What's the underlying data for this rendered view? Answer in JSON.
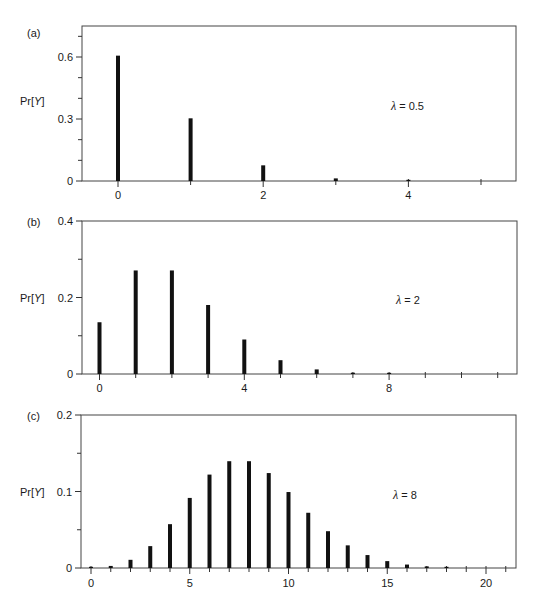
{
  "figure": {
    "colors": {
      "bar": "#111111",
      "axis": "#333333",
      "frame": "#444444",
      "text": "#1a1a1a",
      "background": "#ffffff"
    }
  },
  "chart_data": [
    {
      "type": "bar",
      "panel_label": "(a)",
      "title": "",
      "annotation": {
        "symbol": "λ",
        "text": "= 0.5"
      },
      "lambda": 0.5,
      "ylabel": "Pr[Y]",
      "xlabel": "",
      "x": [
        0,
        1,
        2,
        3,
        4
      ],
      "values": [
        0.6065,
        0.3033,
        0.0758,
        0.0126,
        0.0016
      ],
      "xlim": [
        -0.5,
        5.5
      ],
      "ylim": [
        0,
        0.75
      ],
      "x_major_ticks": [
        0,
        2,
        4
      ],
      "x_tick_labels": [
        "0",
        "2",
        "4"
      ],
      "x_minor_ticks": [
        1,
        3,
        5
      ],
      "y_major_ticks": [
        0,
        0.3,
        0.6
      ],
      "y_tick_labels": [
        "0",
        "0.3",
        "0.6"
      ],
      "y_minor_ticks": [
        0.1,
        0.2,
        0.4,
        0.5,
        0.7
      ],
      "grid": false,
      "legend": "none"
    },
    {
      "type": "bar",
      "panel_label": "(b)",
      "title": "",
      "annotation": {
        "symbol": "λ",
        "text": "= 2"
      },
      "lambda": 2,
      "ylabel": "Pr[Y]",
      "xlabel": "",
      "x": [
        0,
        1,
        2,
        3,
        4,
        5,
        6,
        7,
        8
      ],
      "values": [
        0.1353,
        0.2707,
        0.2707,
        0.1804,
        0.0902,
        0.0361,
        0.012,
        0.0034,
        0.0009
      ],
      "xlim": [
        -0.5,
        11.5
      ],
      "ylim": [
        0,
        0.4
      ],
      "x_major_ticks": [
        0,
        4,
        8
      ],
      "x_tick_labels": [
        "0",
        "4",
        "8"
      ],
      "x_minor_ticks": [
        1,
        2,
        3,
        5,
        6,
        7,
        9,
        10,
        11
      ],
      "y_major_ticks": [
        0,
        0.2,
        0.4
      ],
      "y_tick_labels": [
        "0",
        "0.2",
        "0.4"
      ],
      "y_minor_ticks": [
        0.1,
        0.3
      ],
      "grid": false,
      "legend": "none"
    },
    {
      "type": "bar",
      "panel_label": "(c)",
      "title": "",
      "annotation": {
        "symbol": "λ",
        "text": "= 8"
      },
      "lambda": 8,
      "ylabel": "Pr[Y]",
      "xlabel": "",
      "x": [
        0,
        1,
        2,
        3,
        4,
        5,
        6,
        7,
        8,
        9,
        10,
        11,
        12,
        13,
        14,
        15,
        16,
        17,
        18
      ],
      "values": [
        0.0003,
        0.0027,
        0.0107,
        0.0286,
        0.0573,
        0.0916,
        0.1221,
        0.1396,
        0.1396,
        0.1241,
        0.0993,
        0.0722,
        0.0481,
        0.0296,
        0.0169,
        0.009,
        0.0045,
        0.0021,
        0.0009
      ],
      "xlim": [
        -0.5,
        21.5
      ],
      "ylim": [
        0,
        0.2
      ],
      "x_major_ticks": [
        0,
        5,
        10,
        15,
        20
      ],
      "x_tick_labels": [
        "0",
        "5",
        "10",
        "15",
        "20"
      ],
      "x_minor_ticks": [
        1,
        2,
        3,
        4,
        6,
        7,
        8,
        9,
        11,
        12,
        13,
        14,
        16,
        17,
        18,
        19,
        21
      ],
      "y_major_ticks": [
        0,
        0.1,
        0.2
      ],
      "y_tick_labels": [
        "0",
        "0.1",
        "0.2"
      ],
      "y_minor_ticks": [
        0.05,
        0.15
      ],
      "grid": false,
      "legend": "none"
    }
  ],
  "layout": {
    "panels": [
      {
        "left": 82,
        "right": 516,
        "top": 26,
        "bottom": 181,
        "x0px": 118,
        "dxpx": 72.6,
        "ytop_val": 0.75,
        "label_pos": [
          27,
          37
        ],
        "ylabel_pos": [
          20,
          105
        ],
        "anno_pos": [
          391,
          110
        ],
        "tick_label_y": 199
      },
      {
        "left": 82,
        "right": 517,
        "top": 221,
        "bottom": 374,
        "x0px": 99.5,
        "dxpx": 36.2,
        "ytop_val": 0.4,
        "label_pos": [
          27,
          226
        ],
        "ylabel_pos": [
          20,
          302
        ],
        "anno_pos": [
          396,
          304
        ],
        "tick_label_y": 392
      },
      {
        "left": 81,
        "right": 516,
        "top": 415,
        "bottom": 568,
        "x0px": 91,
        "dxpx": 19.75,
        "ytop_val": 0.2,
        "label_pos": [
          27,
          420
        ],
        "ylabel_pos": [
          20,
          496
        ],
        "anno_pos": [
          393,
          499
        ],
        "tick_label_y": 587
      }
    ]
  }
}
